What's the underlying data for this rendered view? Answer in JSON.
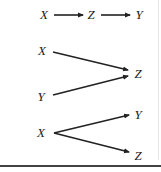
{
  "diagrams": [
    {
      "name": "chain",
      "nodes": [
        {
          "label": "X",
          "x": 44,
          "y": 15
        },
        {
          "label": "Z",
          "x": 91,
          "y": 15
        },
        {
          "label": "Y",
          "x": 139,
          "y": 15
        }
      ],
      "edges": [
        {
          "from": "X",
          "to": "Z",
          "x1": 54,
          "y1": 15,
          "x2": 83,
          "y2": 15
        },
        {
          "from": "Z",
          "to": "Y",
          "x1": 101,
          "y1": 15,
          "x2": 130,
          "y2": 15
        }
      ]
    },
    {
      "name": "collider",
      "nodes": [
        {
          "label": "X",
          "x": 42,
          "y": 51
        },
        {
          "label": "Y",
          "x": 41,
          "y": 97
        },
        {
          "label": "Z",
          "x": 138,
          "y": 74
        }
      ],
      "edges": [
        {
          "from": "X",
          "to": "Z",
          "x1": 53,
          "y1": 52,
          "x2": 128,
          "y2": 70
        },
        {
          "from": "Y",
          "to": "Z",
          "x1": 53,
          "y1": 95,
          "x2": 128,
          "y2": 76
        }
      ]
    },
    {
      "name": "fork",
      "nodes": [
        {
          "label": "X",
          "x": 41,
          "y": 133
        },
        {
          "label": "Y",
          "x": 138,
          "y": 115
        },
        {
          "label": "Z",
          "x": 138,
          "y": 156
        }
      ],
      "edges": [
        {
          "from": "X",
          "to": "Y",
          "x1": 54,
          "y1": 133,
          "x2": 129,
          "y2": 115
        },
        {
          "from": "X",
          "to": "Z",
          "x1": 54,
          "y1": 133,
          "x2": 129,
          "y2": 152
        }
      ]
    }
  ],
  "colors": {
    "stroke": "#222222",
    "text": "#222222",
    "rule": "#444444",
    "border": "#e6e6e6"
  }
}
